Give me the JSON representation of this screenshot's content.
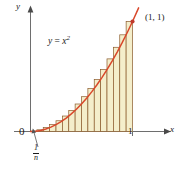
{
  "figure": {
    "kind": "riemann-sum-diagram",
    "caption_labels": {
      "y_axis": "y",
      "x_axis": "x",
      "origin": "0",
      "x_tick_one": "1",
      "curve_label_lhs": "y",
      "curve_label_eq": "=",
      "curve_label_base": "x",
      "curve_label_exponent": "2",
      "point_label": "(1, 1)",
      "width_numerator": "1",
      "width_denominator": "n"
    },
    "colors": {
      "curve": "#D9482B",
      "rect_fill": "#F4EECB",
      "rect_stroke": "#8A5A2B",
      "axis": "#6E6E6E",
      "text": "#1A1A1A",
      "point_dot": "#C0392B",
      "leader": "#555555",
      "background": "#FFFFFF"
    }
  },
  "chart_data": {
    "type": "area",
    "title": "",
    "subtitle": "",
    "xlabel": "x",
    "ylabel": "y",
    "function": "y = x^2",
    "xlim": [
      0,
      1.12
    ],
    "ylim": [
      0,
      1.12
    ],
    "grid": false,
    "legend": null,
    "xticks": [
      0,
      1
    ],
    "xtick_labels": [
      "0",
      "1"
    ],
    "yticks": [],
    "ytick_labels": [],
    "annotations": [
      {
        "text": "y = x²",
        "x": 0.22,
        "y": 0.85,
        "kind": "curve-label"
      },
      {
        "text": "(1, 1)",
        "x": 1.04,
        "y": 1.04,
        "kind": "point-label"
      },
      {
        "text": "1/n",
        "x": 0.0625,
        "y": -0.18,
        "kind": "width-label",
        "leader": true
      }
    ],
    "points": [
      {
        "x": 1,
        "y": 1,
        "label": "(1, 1)",
        "marker": "dot"
      }
    ],
    "riemann": {
      "method": "right-endpoint",
      "n": 16,
      "a": 0,
      "b": 1,
      "subinterval_width": 0.0625,
      "right_endpoints": [
        0.0625,
        0.125,
        0.1875,
        0.25,
        0.3125,
        0.375,
        0.4375,
        0.5,
        0.5625,
        0.625,
        0.6875,
        0.75,
        0.8125,
        0.875,
        0.9375,
        1.0
      ],
      "rect_heights": [
        0.0039,
        0.0156,
        0.0352,
        0.0625,
        0.0977,
        0.1406,
        0.1914,
        0.25,
        0.3164,
        0.3906,
        0.4727,
        0.5625,
        0.6602,
        0.7656,
        0.8789,
        1.0
      ]
    },
    "series": [
      {
        "name": "y = x^2",
        "x": [
          0,
          0.05,
          0.1,
          0.15,
          0.2,
          0.25,
          0.3,
          0.35,
          0.4,
          0.45,
          0.5,
          0.55,
          0.6,
          0.65,
          0.7,
          0.75,
          0.8,
          0.85,
          0.9,
          0.95,
          1.0,
          1.06
        ],
        "values": [
          0,
          0.0025,
          0.01,
          0.0225,
          0.04,
          0.0625,
          0.09,
          0.1225,
          0.16,
          0.2025,
          0.25,
          0.3025,
          0.36,
          0.4225,
          0.49,
          0.5625,
          0.64,
          0.7225,
          0.81,
          0.9025,
          1.0,
          1.1236
        ]
      }
    ]
  }
}
